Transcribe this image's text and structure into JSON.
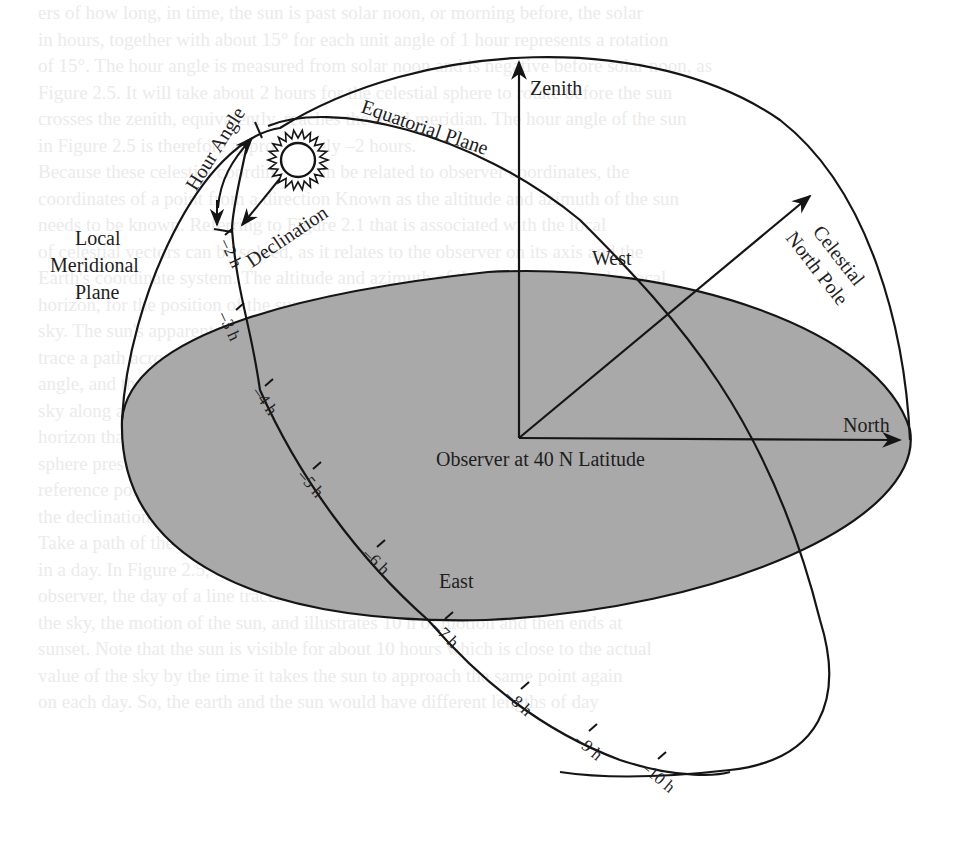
{
  "figure": {
    "colors": {
      "ground_plane": "#a9a9a9",
      "lines": "#151515",
      "background": "#ffffff"
    },
    "labels": {
      "zenith": "Zenith",
      "equatorial_plane": "Equatorial Plane",
      "hour_angle": "Hour Angle",
      "declination": "Declination",
      "local_meridional_plane": [
        "Local",
        "Meridional",
        "Plane"
      ],
      "west": "West",
      "celestial_north_pole": [
        "Celestial",
        "North Pole"
      ],
      "north": "North",
      "east": "East",
      "observer": "Observer at 40 N Latitude"
    },
    "hour_ticks": [
      "–2 h",
      "–3 h",
      "–4 h",
      "–5 h",
      "–6 h",
      "–7 h",
      "–8 h",
      "–9 h",
      "–10 h"
    ],
    "icons": {
      "sun": "sun-icon"
    }
  },
  "ghost_text": [
    "ers of how long, in time, the sun is past solar noon, or morning before, the solar",
    "in hours, together with about 15° for each unit angle of 1 hour represents a rotation",
    "of 15°. The hour angle is measured from solar noon and is negative before solar noon, as",
    "Figure 2.5. It will take about 2 hours for the celestial sphere to rotate before the sun",
    "crosses the zenith, equivalently, reaches the local meridian. The hour angle of the sun",
    "in Figure 2.5 is therefore approximately –2 hours.",
    "   Because these celestial coordinates can be related to observer coordinates, the",
    "coordinates of a point from a direction Known as the altitude and azimuth of the sun",
    "needs to be known. Referring to Figure 2.1 that is associated with the local",
    "of celestial vectors can be solved, as it relates to the observer on its axis and the",
    "Earth's coordinate system. The altitude and azimuth of the sun, relative to the local",
    "horizon, for the position of the sun, is described by these two angles shown in the",
    "sky. The sun's apparent motion as time increases from sunrise to noon and after will",
    "trace a path across the sky that depends on the declination and the north pole",
    "angle, and the observer's latitude. Because the sun appears to move across the",
    "sky along a path parallel to the equatorial plane, it also follows a path on the",
    "horizon that changes with the seasons, and the declination of the sun at that",
    "sphere presents the path a particular day of the year through the sky making a",
    "reference point of the observer's location that changes both the hour angle and",
    "the declination.",
    "   Take a path of the sun around the celestial hemisphere path that the sun travels",
    "in a day. In Figure 2.5, the solar path of the sun at the local meridian, for the",
    "observer, the day of a line traces the sun and the path will be drawn around",
    "the sky, the motion of the sun, and illustrates 10 h of motion and then ends at",
    "sunset. Note that the sun is visible for about 10 hours which is close to the actual",
    "value of the sky by the time it takes the sun to approach the same point again",
    "on each day. So, the earth and the sun would have different lengths of day"
  ]
}
